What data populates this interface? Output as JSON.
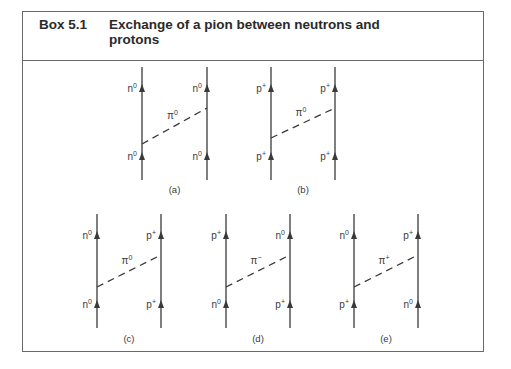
{
  "box": {
    "number": "Box 5.1",
    "title": "Exchange of a pion between neutrons and protons"
  },
  "colors": {
    "line": "#3a3a3a",
    "border": "#6a6a6a"
  },
  "diagrams": [
    {
      "id": "a",
      "caption": "(a)",
      "left_in": "n⁰",
      "left_out": "n⁰",
      "right_in": "n⁰",
      "right_out": "n⁰",
      "pion": "π⁰",
      "pion_base": "π",
      "pion_sup": "0"
    },
    {
      "id": "b",
      "caption": "(b)",
      "left_in": "p⁺",
      "left_out": "p⁺",
      "right_in": "p⁺",
      "right_out": "p⁺",
      "pion": "π⁰",
      "pion_base": "π",
      "pion_sup": "0"
    },
    {
      "id": "c",
      "caption": "(c)",
      "left_in": "n⁰",
      "left_out": "n⁰",
      "right_in": "p⁺",
      "right_out": "p⁺",
      "pion": "π⁰",
      "pion_base": "π",
      "pion_sup": "0"
    },
    {
      "id": "d",
      "caption": "(d)",
      "left_in": "n⁰",
      "left_out": "p⁺",
      "right_in": "p⁺",
      "right_out": "n⁰",
      "pion": "π⁻",
      "pion_base": "π",
      "pion_sup": "−"
    },
    {
      "id": "e",
      "caption": "(e)",
      "left_in": "p⁺",
      "left_out": "n⁰",
      "right_in": "n⁰",
      "right_out": "p⁺",
      "pion": "π⁺",
      "pion_base": "π",
      "pion_sup": "+"
    }
  ],
  "labels": {
    "a": {
      "left_out": [
        "n",
        "0"
      ],
      "left_in": [
        "n",
        "0"
      ],
      "right_out": [
        "n",
        "0"
      ],
      "right_in": [
        "n",
        "0"
      ]
    },
    "b": {
      "left_out": [
        "p",
        "+"
      ],
      "left_in": [
        "p",
        "+"
      ],
      "right_out": [
        "p",
        "+"
      ],
      "right_in": [
        "p",
        "+"
      ]
    },
    "c": {
      "left_out": [
        "n",
        "0"
      ],
      "left_in": [
        "n",
        "0"
      ],
      "right_out": [
        "p",
        "+"
      ],
      "right_in": [
        "p",
        "+"
      ]
    },
    "d": {
      "left_out": [
        "p",
        "+"
      ],
      "left_in": [
        "n",
        "0"
      ],
      "right_out": [
        "n",
        "0"
      ],
      "right_in": [
        "p",
        "+"
      ]
    },
    "e": {
      "left_out": [
        "n",
        "0"
      ],
      "left_in": [
        "p",
        "+"
      ],
      "right_out": [
        "p",
        "+"
      ],
      "right_in": [
        "n",
        "0"
      ]
    }
  }
}
